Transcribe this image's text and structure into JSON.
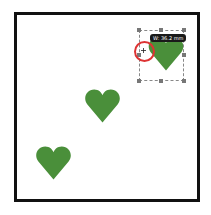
{
  "canvas": {
    "frame_color": "#111111",
    "heart_color": "#4a8f3a",
    "hearts": [
      {
        "name": "selected-heart",
        "x": 148,
        "y": 33,
        "w": 36,
        "h": 38
      },
      {
        "name": "middle-heart",
        "x": 84,
        "y": 88,
        "w": 37,
        "h": 36
      },
      {
        "name": "lower-heart",
        "x": 35,
        "y": 145,
        "w": 37,
        "h": 36
      }
    ]
  },
  "selection": {
    "tooltip": "W: 36.2 mm"
  }
}
